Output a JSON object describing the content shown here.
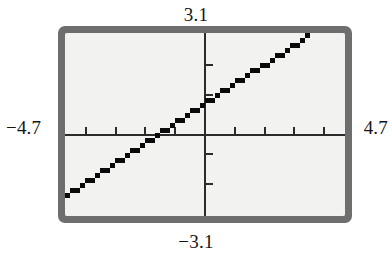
{
  "device": {
    "type": "graphing-calculator-screen",
    "bezel_color": "#6e6e6e",
    "screen_color": "#f2f2f0",
    "ink_color": "#0a0a0a"
  },
  "labels": {
    "x_min": "−4.7",
    "x_max": "4.7",
    "y_max": "3.1",
    "y_min": "−3.1"
  },
  "chart_data": {
    "type": "line",
    "title": "",
    "subtitle": "",
    "xlabel": "",
    "ylabel": "",
    "xlim": [
      -4.7,
      4.7
    ],
    "ylim": [
      -3.1,
      3.1
    ],
    "grid": false,
    "legend": null,
    "axes": {
      "x_axis_visible": true,
      "y_axis_visible": true,
      "x_tick_step": 1,
      "y_tick_step": 1,
      "x_ticks": [
        -4,
        -3,
        -2,
        -1,
        1,
        2,
        3,
        4
      ],
      "y_ticks": [
        -2,
        -1,
        1,
        2
      ],
      "tick_labels_shown": false
    },
    "annotations": [
      "Window values shown at screen edges: Xmin = -4.7, Xmax = 4.7, Ymin = -3.1, Ymax = 3.1"
    ],
    "series": [
      {
        "name": "y = 0.67x + 0.75",
        "style": "solid-pixelated",
        "color": "#0a0a0a",
        "slope": 0.67,
        "intercept": 0.75,
        "x_intercept": -1.12,
        "x": [
          -4.7,
          -4.0,
          -3.0,
          -2.0,
          -1.12,
          -1.0,
          0.0,
          1.0,
          2.0,
          3.0,
          4.0,
          4.7
        ],
        "y": [
          -2.4,
          -1.93,
          -1.26,
          -0.59,
          0.0,
          0.08,
          0.75,
          1.42,
          2.09,
          2.76,
          3.43,
          3.9
        ]
      }
    ]
  }
}
